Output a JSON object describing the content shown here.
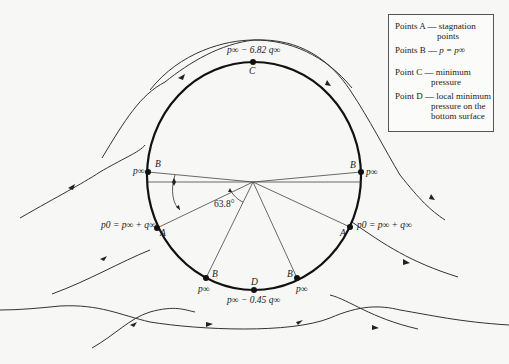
{
  "diagram": {
    "points": {
      "C": {
        "label": "C",
        "pressure": "p∞ − 6.82 q∞"
      },
      "D": {
        "label": "D",
        "pressure": "p∞ − 0.45 q∞"
      },
      "B_left": {
        "label": "B",
        "pressure": "p∞"
      },
      "B_right": {
        "label": "B",
        "pressure": "p∞"
      },
      "B_bottom_left": {
        "label": "B",
        "pressure": "p∞"
      },
      "B_bottom_right": {
        "label": "B",
        "pressure": "p∞"
      },
      "A_left": {
        "label": "A",
        "pressure": "p0 = p∞ + q∞"
      },
      "A_right": {
        "label": "A",
        "pressure": "p0 = p∞ + q∞"
      }
    },
    "angle_label": "63.8°"
  },
  "legend": {
    "items": [
      {
        "key": "Points A —",
        "value_line1": "stagnation",
        "value_line2": "points"
      },
      {
        "key": "Points B —",
        "value_line1": "p = p∞",
        "value_line2": ""
      },
      {
        "key": "Point C —",
        "value_line1": "minimum",
        "value_line2": "pressure"
      },
      {
        "key": "Point D —",
        "value_line1": "local minimum",
        "value_line2": "pressure on the",
        "value_line3": "bottom surface"
      }
    ]
  }
}
